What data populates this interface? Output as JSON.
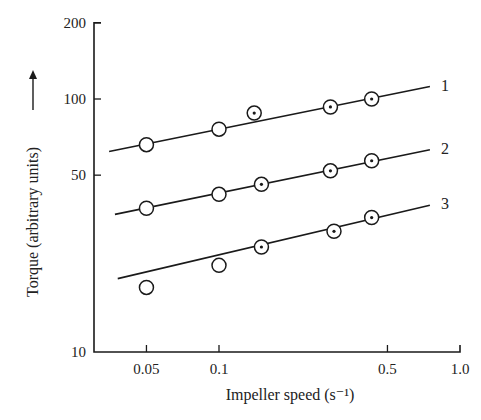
{
  "chart_data": {
    "type": "scatter",
    "title": "",
    "xlabel": "Impeller speed (s⁻¹)",
    "ylabel": "Torque (arbitrary units)",
    "xscale": "log",
    "yscale": "log",
    "xlim": [
      0.03,
      1.0
    ],
    "ylim": [
      10,
      200
    ],
    "x_ticks": [
      0.05,
      0.1,
      0.5,
      1.0
    ],
    "x_tick_labels": [
      "0.05",
      "0.1",
      "0.5",
      "1.0"
    ],
    "y_ticks": [
      10,
      50,
      100,
      200
    ],
    "y_tick_labels": [
      "10",
      "50",
      "100",
      "200"
    ],
    "grid": false,
    "legend": "inline labels at right end of fit lines",
    "series": [
      {
        "name": "1",
        "fit_line": {
          "x": [
            0.035,
            0.75
          ],
          "y": [
            62,
            112
          ]
        },
        "points": [
          {
            "x": 0.05,
            "y": 66,
            "marker": "open-circle"
          },
          {
            "x": 0.1,
            "y": 76,
            "marker": "open-circle"
          },
          {
            "x": 0.14,
            "y": 88,
            "marker": "dotted-circle"
          },
          {
            "x": 0.29,
            "y": 93,
            "marker": "dotted-circle"
          },
          {
            "x": 0.43,
            "y": 100,
            "marker": "dotted-circle"
          }
        ]
      },
      {
        "name": "2",
        "fit_line": {
          "x": [
            0.037,
            0.75
          ],
          "y": [
            35,
            63
          ]
        },
        "points": [
          {
            "x": 0.05,
            "y": 37,
            "marker": "open-circle"
          },
          {
            "x": 0.1,
            "y": 42,
            "marker": "open-circle"
          },
          {
            "x": 0.15,
            "y": 46,
            "marker": "dotted-circle"
          },
          {
            "x": 0.29,
            "y": 52,
            "marker": "dotted-circle"
          },
          {
            "x": 0.43,
            "y": 57,
            "marker": "dotted-circle"
          }
        ]
      },
      {
        "name": "3",
        "fit_line": {
          "x": [
            0.038,
            0.75
          ],
          "y": [
            19.5,
            38
          ]
        },
        "points": [
          {
            "x": 0.05,
            "y": 18,
            "marker": "open-circle"
          },
          {
            "x": 0.1,
            "y": 22,
            "marker": "open-circle"
          },
          {
            "x": 0.15,
            "y": 26,
            "marker": "dotted-circle"
          },
          {
            "x": 0.3,
            "y": 30,
            "marker": "dotted-circle"
          },
          {
            "x": 0.43,
            "y": 34,
            "marker": "dotted-circle"
          }
        ]
      }
    ]
  },
  "colors": {
    "ink": "#1a1a1a",
    "background": "#ffffff"
  }
}
